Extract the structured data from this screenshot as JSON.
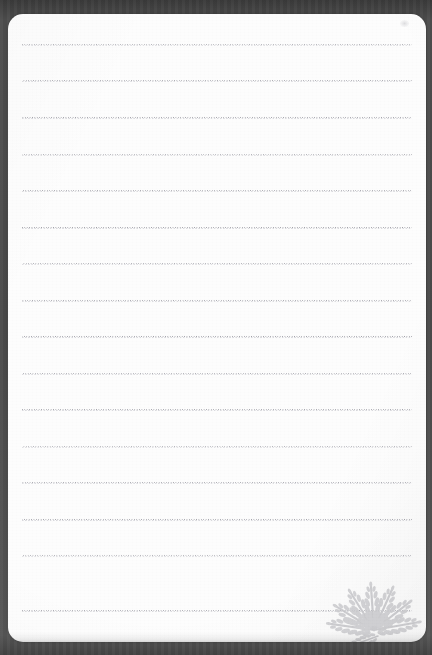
{
  "document": {
    "kind": "scanned-notebook-page",
    "title": "Blank lined notebook page",
    "page_text": "",
    "has_handwriting": false,
    "canvas": {
      "width": 432,
      "height": 655
    }
  },
  "colors": {
    "backdrop": "#4a4a4a",
    "paper": "#fdfdfd",
    "rule_line": "#9a9aa2",
    "rule_line_ghost": "#c3c3ca",
    "fern": "#cfcfd2",
    "fern_shadow": "#b9b9bd"
  },
  "paper": {
    "left": 8,
    "top": 14,
    "width": 418,
    "height": 628,
    "corner_radius": 15
  },
  "ruled_lines": {
    "style": "dotted",
    "count": 16,
    "left": 22,
    "right": 412,
    "first_y": 44,
    "spacing": 36.5,
    "y_positions": [
      44,
      80,
      117,
      154,
      190,
      227,
      263,
      300,
      336,
      373,
      409,
      446,
      482,
      519,
      555,
      610
    ],
    "label": "ruled writing line"
  },
  "marks": [
    {
      "name": "smudge",
      "x": 400,
      "y": 20,
      "label": "faint scan smudge"
    }
  ],
  "decoration": {
    "name": "fern-leaf-ornament",
    "label": "Fern frond ornament",
    "position": "bottom-right",
    "frond_count": 7
  }
}
